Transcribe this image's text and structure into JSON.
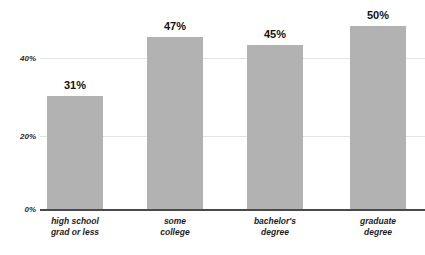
{
  "chart_data": {
    "type": "bar",
    "title": "",
    "subtitle": "",
    "xlabel": "",
    "ylabel": "",
    "categories": [
      "high school grad or less",
      "some college",
      "bachelor's degree",
      "graduate degree"
    ],
    "category_lines": [
      [
        "high school",
        "grad or less"
      ],
      [
        "some",
        "college"
      ],
      [
        "bachelor's",
        "degree"
      ],
      [
        "graduate",
        "degree"
      ]
    ],
    "values": [
      31,
      47,
      45,
      50
    ],
    "value_labels": [
      "31%",
      "47%",
      "45%",
      "50%"
    ],
    "ylim": [
      0,
      55
    ],
    "yticks": [
      0,
      20,
      40
    ],
    "ytick_labels": [
      "0%",
      "20%",
      "40%"
    ],
    "grid": true,
    "legend": "none",
    "bar_color": "#b2b2b2",
    "axis_color": "#4a4a4a",
    "gridline_color": "#e3e3e3",
    "text_color": "#1c1c1c",
    "background": "#ffffff"
  }
}
